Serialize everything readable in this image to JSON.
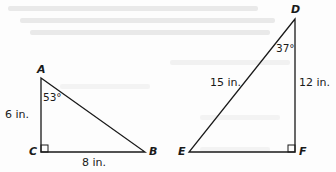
{
  "colors": {
    "stroke": "#1a1a1a",
    "background": "#fdfdfd",
    "ghost_text": "#e9e9e9"
  },
  "triangles": [
    {
      "name": "ABC",
      "vertices": {
        "A": "A",
        "B": "B",
        "C": "C"
      },
      "right_angle_at": "C",
      "angle_label": "53°",
      "angle_at": "A",
      "sides": {
        "AC": "6 in.",
        "CB": "8 in."
      }
    },
    {
      "name": "DEF",
      "vertices": {
        "D": "D",
        "E": "E",
        "F": "F"
      },
      "right_angle_at": "F",
      "angle_label": "37°",
      "angle_at": "D",
      "sides": {
        "DE": "15 in.",
        "DF": "12 in."
      }
    }
  ]
}
